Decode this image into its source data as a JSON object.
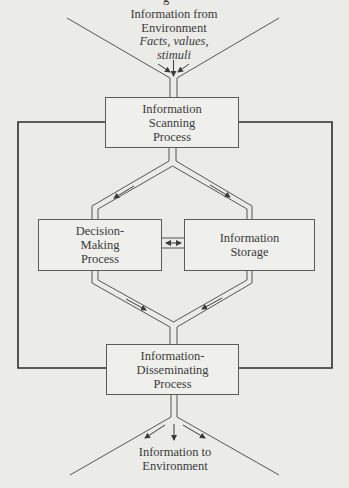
{
  "diagram": {
    "type": "information-processing-flow",
    "top_partial_text": "g",
    "input": {
      "line1": "Information from",
      "line2": "Environment",
      "line3": "Facts, values,",
      "line4": "stimuli"
    },
    "nodes": {
      "scanning": {
        "line1": "Information",
        "line2": "Scanning",
        "line3": "Process"
      },
      "decision": {
        "line1": "Decision-",
        "line2": "Making",
        "line3": "Process"
      },
      "storage": {
        "line1": "Information",
        "line2": "Storage"
      },
      "disseminating": {
        "line1": "Information-",
        "line2": "Disseminating",
        "line3": "Process"
      }
    },
    "output": {
      "line1": "Information to",
      "line2": "Environment"
    },
    "edges": [
      {
        "from": "environment",
        "to": "scanning",
        "style": "double-pipe"
      },
      {
        "from": "scanning",
        "to": "decision",
        "style": "double-pipe",
        "arrow": "down-left"
      },
      {
        "from": "scanning",
        "to": "storage",
        "style": "double-pipe",
        "arrow": "down-right"
      },
      {
        "from": "decision",
        "to": "storage",
        "style": "double-pipe",
        "arrow": "bidirectional"
      },
      {
        "from": "decision",
        "to": "disseminating",
        "style": "double-pipe",
        "arrow": "down-right"
      },
      {
        "from": "storage",
        "to": "disseminating",
        "style": "double-pipe",
        "arrow": "down-left"
      },
      {
        "from": "disseminating",
        "to": "environment",
        "style": "double-pipe"
      },
      {
        "from": "disseminating",
        "to": "scanning",
        "style": "feedback-loop",
        "sides": [
          "left",
          "right"
        ]
      }
    ],
    "colors": {
      "background": "#ebebe8",
      "line": "#4a4a4a",
      "feedback": "#2e2e2e",
      "text": "#3a3a3a"
    }
  }
}
